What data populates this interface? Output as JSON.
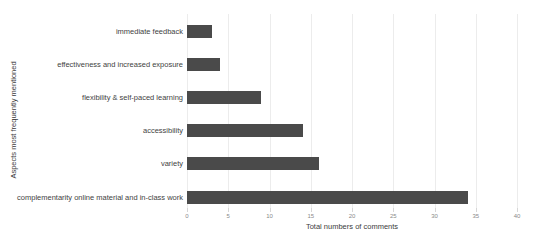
{
  "chart_data": {
    "type": "bar",
    "orientation": "horizontal",
    "title": "",
    "categories": [
      "immediate feedback",
      "effectiveness and increased exposure",
      "flexibility & self-paced learning",
      "accessibility",
      "variety",
      "complementarity online material and in-class work"
    ],
    "values": [
      3,
      4,
      9,
      14,
      16,
      34
    ],
    "xlabel": "Total numbers of comments",
    "ylabel": "Aspects most frequently mentioned",
    "xlim": [
      0,
      40
    ],
    "xticks": [
      0,
      5,
      10,
      15,
      20,
      25,
      30,
      35,
      40
    ],
    "grid": true,
    "legend": "none",
    "bar_color": "#4a4a4a",
    "gridline_color": "#ececec",
    "tick_label_color": "#8a8a8a",
    "category_label_color": "#3f3f3f"
  }
}
